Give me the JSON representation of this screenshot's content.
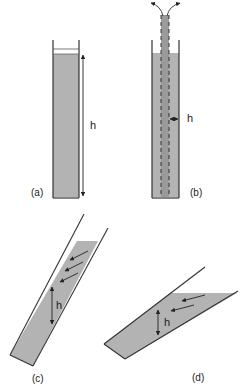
{
  "figure": {
    "panels": [
      {
        "id": "a",
        "label": "(a)",
        "dimension_label": "h",
        "description": "vertical tube filled with fluid, height h"
      },
      {
        "id": "b",
        "label": "(b)",
        "dimension_label": "h",
        "description": "vertical tube with central dashed rod, gap h, flow exits at top"
      },
      {
        "id": "c",
        "label": "(c)",
        "dimension_label": "h",
        "description": "steeply tilted channel with fluid layer of thickness h, flow arrows"
      },
      {
        "id": "d",
        "label": "(d)",
        "dimension_label": "h",
        "description": "shallowly tilted channel with fluid layer of thickness h, flow arrows"
      }
    ],
    "colors": {
      "fill": "#b3b3b3",
      "fill_dark": "#9a9a9a",
      "stroke": "#333333",
      "background": "#ffffff"
    }
  }
}
